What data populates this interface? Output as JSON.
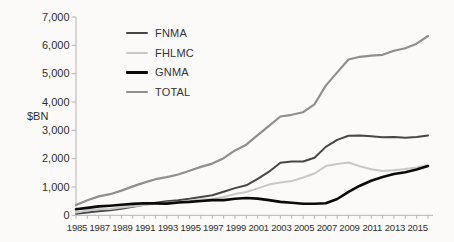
{
  "chart": {
    "y_axis_label": "$BN",
    "legend": [
      "FNMA",
      "FHLMC",
      "GNMA",
      "TOTAL"
    ]
  },
  "chart_data": {
    "type": "line",
    "title": "",
    "xlabel": "",
    "ylabel": "$BN",
    "x": [
      1985,
      1986,
      1987,
      1988,
      1989,
      1990,
      1991,
      1992,
      1993,
      1994,
      1995,
      1996,
      1997,
      1998,
      1999,
      2000,
      2001,
      2002,
      2003,
      2004,
      2005,
      2006,
      2007,
      2008,
      2009,
      2010,
      2011,
      2012,
      2013,
      2014,
      2015,
      2016
    ],
    "x_tick_labels": [
      "1985",
      "1987",
      "1989",
      "1991",
      "1993",
      "1995",
      "1997",
      "1999",
      "2001",
      "2003",
      "2005",
      "2007",
      "2009",
      "2011",
      "2013",
      "2015"
    ],
    "ylim": [
      0,
      7000
    ],
    "y_ticks": [
      0,
      1000,
      2000,
      3000,
      4000,
      5000,
      6000,
      7000
    ],
    "grid": false,
    "legend_position": "top-left-inside",
    "axis_color": "#b5b5b5",
    "text_color": "#2e2e2e",
    "series": [
      {
        "name": "FNMA",
        "color": "#474747",
        "width": 2,
        "values": [
          55,
          97,
          140,
          178,
          228,
          300,
          372,
          445,
          495,
          530,
          583,
          650,
          710,
          834,
          960,
          1058,
          1290,
          1538,
          1857,
          1895,
          1898,
          2030,
          2414,
          2661,
          2807,
          2817,
          2792,
          2755,
          2761,
          2740,
          2759,
          2821
        ]
      },
      {
        "name": "FHLMC",
        "color": "#c8c8c8",
        "width": 2,
        "values": [
          100,
          169,
          213,
          226,
          273,
          316,
          359,
          408,
          440,
          461,
          515,
          554,
          579,
          646,
          749,
          822,
          948,
          1082,
          1157,
          1209,
          1335,
          1477,
          1738,
          1807,
          1865,
          1731,
          1625,
          1562,
          1592,
          1637,
          1684,
          1769
        ]
      },
      {
        "name": "GNMA",
        "color": "#0a0a0a",
        "width": 2.6,
        "values": [
          212,
          262,
          315,
          340,
          370,
          404,
          425,
          420,
          414,
          451,
          472,
          506,
          536,
          537,
          582,
          612,
          591,
          537,
          474,
          442,
          405,
          410,
          428,
          577,
          826,
          1046,
          1222,
          1347,
          1457,
          1522,
          1613,
          1741
        ]
      },
      {
        "name": "TOTAL",
        "color": "#8f8f8f",
        "width": 2.2,
        "values": [
          367,
          528,
          668,
          744,
          871,
          1020,
          1156,
          1273,
          1349,
          1442,
          1570,
          1710,
          1825,
          2017,
          2291,
          2492,
          2829,
          3157,
          3488,
          3546,
          3638,
          3917,
          4580,
          5045,
          5498,
          5594,
          5639,
          5664,
          5810,
          5899,
          6056,
          6331
        ]
      }
    ]
  }
}
